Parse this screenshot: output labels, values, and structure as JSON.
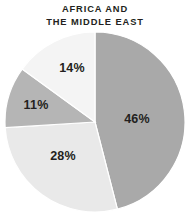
{
  "chart_data": {
    "type": "pie",
    "title": "AFRICA AND\nTHE MIDDLE EAST",
    "title_line_1": "AFRICA AND",
    "title_line_2": "THE MIDDLE EAST",
    "xlabel": "",
    "ylabel": "",
    "legend": "none",
    "grid": false,
    "units": "percent",
    "start_angle_deg": 0,
    "direction": "clockwise",
    "categories": [
      "46%",
      "28%",
      "11%",
      "14%"
    ],
    "values": [
      46,
      28,
      11,
      14
    ],
    "total": 99,
    "slices": [
      {
        "label": "46%",
        "value": 46,
        "color": "#a9a9a9",
        "start_deg": 0,
        "sweep_deg": 165.6,
        "label_x": 137,
        "label_y": 119
      },
      {
        "label": "28%",
        "value": 28,
        "color": "#e9e9e9",
        "start_deg": 165.6,
        "sweep_deg": 100.8,
        "label_x": 63,
        "label_y": 156
      },
      {
        "label": "11%",
        "value": 11,
        "color": "#b5b5b5",
        "start_deg": 266.4,
        "sweep_deg": 39.6,
        "label_x": 36,
        "label_y": 105
      },
      {
        "label": "14%",
        "value": 14,
        "color": "#f4f4f4",
        "start_deg": 306.0,
        "sweep_deg": 54.0,
        "label_x": 72,
        "label_y": 68
      }
    ],
    "colors": {
      "background": "#ffffff",
      "text": "#231f20",
      "slice_stroke": "#ffffff"
    }
  }
}
